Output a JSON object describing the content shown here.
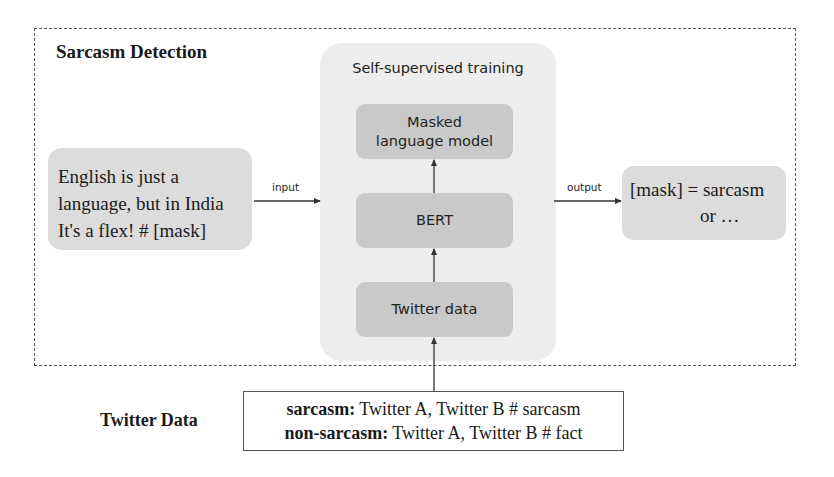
{
  "diagram": {
    "outer_section": {
      "title": "Sarcasm Detection"
    },
    "input_text": {
      "lines": [
        "English is just a",
        "language, but in India",
        "It's a flex! # [mask]"
      ]
    },
    "input_arrow_label": "input",
    "self_supervised": {
      "label": "Self-supervised training",
      "modules": [
        {
          "id": "mlm",
          "lines": [
            "Masked",
            "language model"
          ]
        },
        {
          "id": "bert",
          "lines": [
            "BERT"
          ]
        },
        {
          "id": "twitter",
          "lines": [
            "Twitter data"
          ]
        }
      ]
    },
    "output_arrow_label": "output",
    "output_text": {
      "lines": [
        "[mask] = sarcasm",
        "or …"
      ]
    },
    "twitter_data": {
      "title": "Twitter Data",
      "rows": [
        {
          "label": "sarcasm:",
          "text": " Twitter A, Twitter B # sarcasm"
        },
        {
          "label": "non-sarcasm:",
          "text": " Twitter A, Twitter B # fact"
        }
      ]
    },
    "colors": {
      "region_bg": "#ededed",
      "module_bg": "#c9c9c9",
      "text_box_bg": "#dcdcdc",
      "line": "#333333"
    }
  }
}
